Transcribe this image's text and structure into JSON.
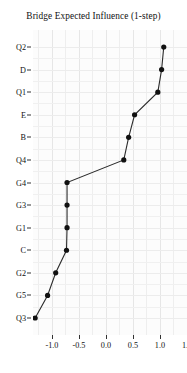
{
  "chart_data": {
    "type": "line",
    "title": "Bridge Expected Influence (1-step)",
    "xlabel": "",
    "ylabel": "",
    "orientation": "horizontal",
    "grid": true,
    "legend": false,
    "xlim": [
      -1.35,
      1.5
    ],
    "xticks": [
      -1.0,
      -0.5,
      0.0,
      0.5,
      1.0,
      1.5
    ],
    "xticklabels": [
      "-1.0",
      "-0.5",
      "0.0",
      "0.5",
      "1.0",
      "1.5"
    ],
    "categories": [
      "Q2",
      "D",
      "Q1",
      "E",
      "B",
      "Q4",
      "G4",
      "G3",
      "G1",
      "C",
      "G2",
      "G5",
      "Q3"
    ],
    "values": [
      1.07,
      1.03,
      0.96,
      0.53,
      0.42,
      0.33,
      -0.72,
      -0.72,
      -0.72,
      -0.73,
      -0.93,
      -1.08,
      -1.31
    ],
    "points": [
      {
        "label": "Q2",
        "value": 1.07
      },
      {
        "label": "D",
        "value": 1.03
      },
      {
        "label": "Q1",
        "value": 0.96
      },
      {
        "label": "E",
        "value": 0.53
      },
      {
        "label": "B",
        "value": 0.42
      },
      {
        "label": "Q4",
        "value": 0.33
      },
      {
        "label": "G4",
        "value": -0.72
      },
      {
        "label": "G3",
        "value": -0.72
      },
      {
        "label": "G1",
        "value": -0.72
      },
      {
        "label": "C",
        "value": -0.73
      },
      {
        "label": "G2",
        "value": -0.93
      },
      {
        "label": "G5",
        "value": -1.08
      },
      {
        "label": "Q3",
        "value": -1.31
      }
    ],
    "colors": {
      "point": "#111111",
      "line": "#2b2b2b",
      "panel_background": "#fcfcfc",
      "grid": "#ececec",
      "text": "#111111"
    }
  }
}
